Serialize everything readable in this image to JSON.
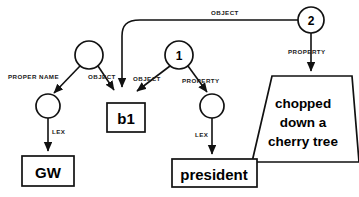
{
  "diagram": {
    "type": "semantic-network",
    "nodes": [
      {
        "id": "n-root",
        "kind": "circle",
        "label": "",
        "x": 89,
        "y": 55,
        "r": 14
      },
      {
        "id": "n-one",
        "kind": "circle",
        "label": "1",
        "x": 179,
        "y": 55,
        "r": 14
      },
      {
        "id": "n-two",
        "kind": "circle",
        "label": "2",
        "x": 311,
        "y": 20,
        "r": 13
      },
      {
        "id": "n-propername",
        "kind": "circle",
        "label": "",
        "x": 48,
        "y": 106,
        "r": 12
      },
      {
        "id": "n-property",
        "kind": "circle",
        "label": "",
        "x": 212,
        "y": 106,
        "r": 12
      },
      {
        "id": "n-b1",
        "kind": "box",
        "label": "b1",
        "x": 107,
        "y": 103,
        "w": 38,
        "h": 29
      },
      {
        "id": "n-gw",
        "kind": "box",
        "label": "GW",
        "x": 22,
        "y": 156,
        "w": 52,
        "h": 30
      },
      {
        "id": "n-president",
        "kind": "box",
        "label": "president",
        "x": 172,
        "y": 159,
        "w": 85,
        "h": 28
      },
      {
        "id": "n-chopped",
        "kind": "trapezoid",
        "label": "chopped down a cherry tree",
        "lines": [
          "chopped",
          "down a",
          "cherry tree"
        ],
        "x": 252,
        "y": 76,
        "w": 104,
        "h": 86
      }
    ],
    "edges": [
      {
        "id": "e-proper-name",
        "label": "PROPER NAME",
        "from": "n-root",
        "to": "n-propername",
        "label_x": 8,
        "label_y": 79
      },
      {
        "id": "e-object-left",
        "label": "OBJECT",
        "from": "n-root",
        "to": "n-b1",
        "label_x": 88,
        "label_y": 79
      },
      {
        "id": "e-object-mid",
        "label": "OBJECT",
        "from": "n-one",
        "to": "n-b1",
        "label_x": 133,
        "label_y": 81
      },
      {
        "id": "e-property-mid",
        "label": "PROPERTY",
        "from": "n-one",
        "to": "n-property",
        "label_x": 182,
        "label_y": 83
      },
      {
        "id": "e-object-top",
        "label": "OBJECT",
        "from": "n-two",
        "to": "n-b1",
        "label_x": 211,
        "label_y": 15
      },
      {
        "id": "e-property-right",
        "label": "PROPERTY",
        "from": "n-two",
        "to": "n-chopped",
        "label_x": 288,
        "label_y": 54
      },
      {
        "id": "e-lex-left",
        "label": "LEX",
        "from": "n-propername",
        "to": "n-gw",
        "label_x": 52,
        "label_y": 134
      },
      {
        "id": "e-lex-right",
        "label": "LEX",
        "from": "n-property",
        "to": "n-president",
        "label_x": 195,
        "label_y": 137
      }
    ],
    "colors": {
      "stroke": "#111111",
      "fill": "#ffffff",
      "text": "#000000"
    }
  }
}
